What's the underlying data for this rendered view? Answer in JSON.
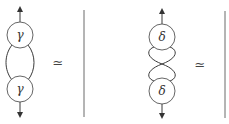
{
  "diagram": {
    "title": "",
    "panels": [
      {
        "name": "gamma-loop",
        "top_node": {
          "label": "γ"
        },
        "bottom_node": {
          "label": "γ"
        },
        "connection": "two parallel strands forming a loop",
        "relation": "≃",
        "result": "identity strand"
      },
      {
        "name": "delta-twist",
        "top_node": {
          "label": "δ"
        },
        "bottom_node": {
          "label": "δ"
        },
        "connection": "two strands twisted (double crossing)",
        "relation": "≃",
        "result": "identity strand"
      }
    ],
    "colors": {
      "stroke": "#3a3a3a",
      "background": "#ffffff"
    }
  }
}
